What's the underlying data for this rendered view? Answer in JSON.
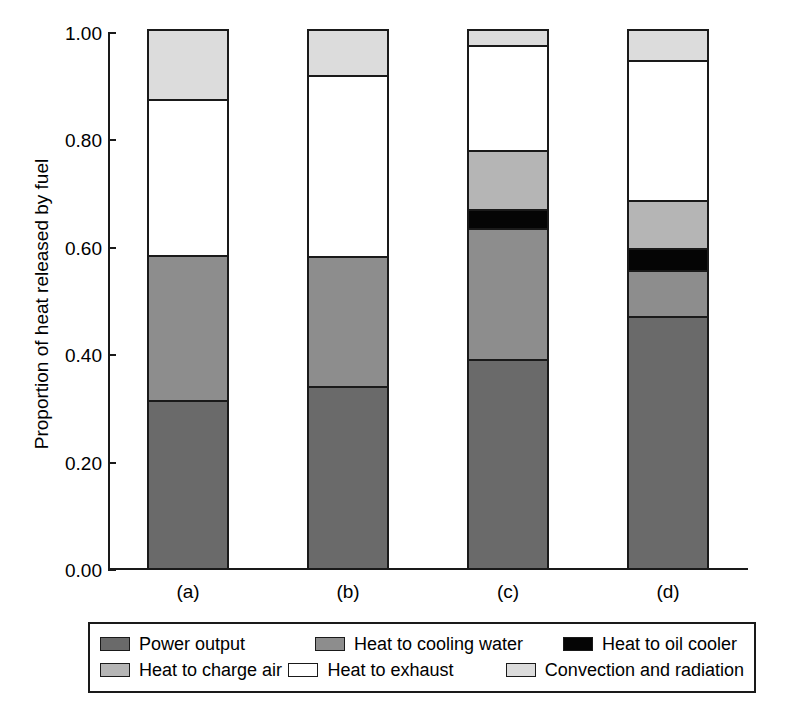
{
  "chart_data": {
    "type": "bar",
    "subtype": "stacked",
    "title": "",
    "xlabel": "",
    "ylabel": "Proportion of heat released by fuel",
    "categories": [
      "(a)",
      "(b)",
      "(c)",
      "(d)"
    ],
    "ylim": [
      0.0,
      1.0
    ],
    "yticks": [
      "0.00",
      "0.20",
      "0.40",
      "0.60",
      "0.80",
      "1.00"
    ],
    "ytick_values": [
      0.0,
      0.2,
      0.4,
      0.6,
      0.8,
      1.0
    ],
    "grid": false,
    "legend_position": "bottom",
    "series": [
      {
        "name": "Power output",
        "color": "#6a6a6a",
        "values": [
          0.31,
          0.335,
          0.385,
          0.465
        ]
      },
      {
        "name": "Heat to cooling water",
        "color": "#8d8d8d",
        "values": [
          0.27,
          0.243,
          0.245,
          0.087
        ]
      },
      {
        "name": "Heat to oil cooler",
        "color": "#050505",
        "values": [
          0.0,
          0.0,
          0.035,
          0.04
        ]
      },
      {
        "name": "Heat to charge air",
        "color": "#b5b5b5",
        "values": [
          0.0,
          0.0,
          0.11,
          0.09
        ]
      },
      {
        "name": "Heat to exhaust",
        "color": "#ffffff",
        "values": [
          0.29,
          0.337,
          0.195,
          0.26
        ]
      },
      {
        "name": "Convection and radiation",
        "color": "#dcdcdc",
        "values": [
          0.13,
          0.085,
          0.03,
          0.058
        ]
      }
    ]
  },
  "legend": {
    "entries": [
      {
        "label": "Power output",
        "swatch_class": "c-power"
      },
      {
        "label": "Heat to cooling water",
        "swatch_class": "c-cooling"
      },
      {
        "label": "Heat to oil cooler",
        "swatch_class": "c-oil"
      },
      {
        "label": "Heat to charge air",
        "swatch_class": "c-charge"
      },
      {
        "label": "Heat to exhaust",
        "swatch_class": "c-exhaust"
      },
      {
        "label": "Convection and radiation",
        "swatch_class": "c-conv"
      }
    ]
  }
}
